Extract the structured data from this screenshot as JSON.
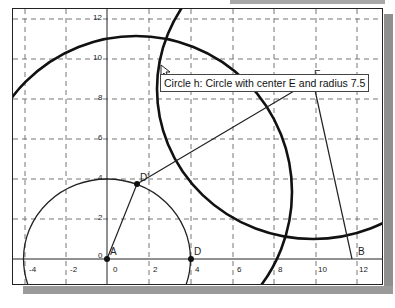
{
  "window": {
    "type": "geometry-graphics-view"
  },
  "axes": {
    "x_ticks": [
      "-4",
      "-2",
      "0",
      "2",
      "4",
      "6",
      "8",
      "10",
      "12"
    ],
    "y_ticks": [
      "0",
      "2",
      "4",
      "6",
      "8",
      "10",
      "12"
    ],
    "grid": "dashed"
  },
  "points": [
    {
      "name": "A",
      "label": "A",
      "x": 0,
      "y": 0
    },
    {
      "name": "D",
      "label": "D",
      "x": 4,
      "y": 0
    },
    {
      "name": "D'",
      "label": "D'",
      "x": 1.4,
      "y": 3.75
    },
    {
      "name": "E",
      "label": "E",
      "x": 9.9,
      "y": 8.5
    },
    {
      "name": "B",
      "label": "B",
      "x": 11.8,
      "y": 0
    }
  ],
  "objects": {
    "circle_A": "Circle with center A through D",
    "circle_h": "Circle with center E and radius 7.5",
    "circle_other": "Circle through D'",
    "segments": [
      "A-D'",
      "D'-E",
      "E-B"
    ]
  },
  "tooltip": {
    "text": "Circle h: Circle with center E and radius 7.5"
  },
  "colors": {
    "line": "#111111",
    "grid": "#777777",
    "shadow": "#8f8f8f"
  }
}
